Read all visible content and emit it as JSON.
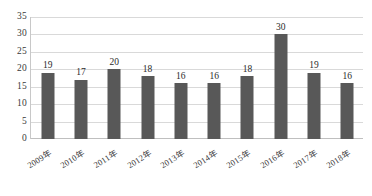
{
  "chart_data": {
    "type": "bar",
    "title": "",
    "subtitle": "",
    "xlabel": "",
    "ylabel": "",
    "categories": [
      "2009年",
      "2010年",
      "2011年",
      "2012年",
      "2013年",
      "2014年",
      "2015年",
      "2016年",
      "2017年",
      "2018年"
    ],
    "values": [
      19,
      17,
      20,
      18,
      16,
      16,
      18,
      30,
      19,
      16
    ],
    "data_labels": [
      "19",
      "17",
      "20",
      "18",
      "16",
      "16",
      "18",
      "30",
      "19",
      "16"
    ],
    "ylim": [
      0,
      35
    ],
    "ytick_labels": [
      "0",
      "5",
      "10",
      "15",
      "20",
      "25",
      "30",
      "35"
    ],
    "ytick_values": [
      0,
      5,
      10,
      15,
      20,
      25,
      30,
      35
    ],
    "grid": true,
    "grid_axis": "y",
    "legend": false,
    "legend_position": "none",
    "colors": {
      "bar": "#585858",
      "gridline": "#d9d9d9",
      "axis": "#bfbfbf",
      "text": "#3a3a3a",
      "background": "#ffffff"
    }
  }
}
